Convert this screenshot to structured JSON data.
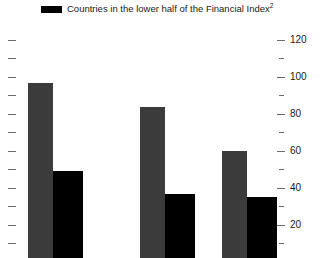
{
  "legend": {
    "series": [
      {
        "label": "Countries in the lower half of the Financial Index",
        "footnote": "2",
        "color": "#000000",
        "swatch_name": "legend-swatch-black"
      }
    ]
  },
  "axis": {
    "right": {
      "labels": [
        "120",
        "100",
        "80",
        "60",
        "40",
        "20"
      ],
      "values": [
        120,
        100,
        80,
        60,
        40,
        20
      ],
      "minor_ticks": [
        110,
        90,
        70,
        50,
        30,
        10
      ]
    },
    "left": {
      "labels": [],
      "tick_count": 13
    }
  },
  "chart_data": {
    "type": "bar",
    "title": "",
    "subtitle": "",
    "xlabel": "",
    "ylabel": "",
    "ylim": [
      0,
      130
    ],
    "grid": false,
    "legend_position": "top",
    "categories": [
      "Group 1",
      "Group 2",
      "Group 3"
    ],
    "series": [
      {
        "name": "Countries in the upper half of the Financial Index",
        "color": "#3b3b3b",
        "values": [
          97,
          84,
          60
        ]
      },
      {
        "name": "Countries in the lower half of the Financial Index",
        "color": "#000000",
        "values": [
          49,
          37,
          35
        ]
      }
    ]
  },
  "colors": {
    "series_gray": "#3b3b3b",
    "series_black": "#000000",
    "tick": "#6b6b6b",
    "text": "#1a1a1a",
    "background": "#ffffff"
  }
}
